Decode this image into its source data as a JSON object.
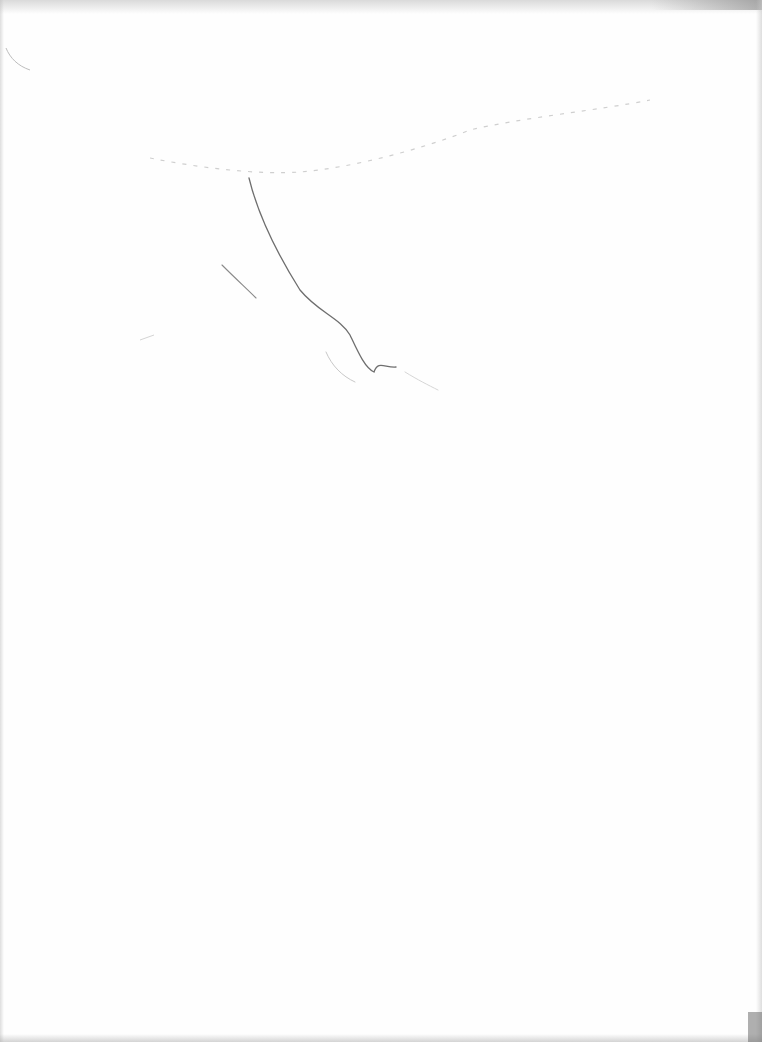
{
  "document": {
    "type": "scanned blank page",
    "text_content": "",
    "colors": {
      "paper": "#fefefe",
      "pencil_dark": "#6e6e6e",
      "pencil_light": "#c8c8c8",
      "scan_edge": "#9a9a9a"
    },
    "marks": [
      {
        "name": "main-curved-stroke",
        "description": "long pencil curve descending from upper center"
      },
      {
        "name": "short-diagonal-stroke",
        "description": "short diagonal pencil stroke to the left"
      },
      {
        "name": "faint-arc-stroke",
        "description": "faint arc near the bottom of the main curve"
      },
      {
        "name": "dotted-top-arc",
        "description": "faint dotted arc across upper part of page"
      }
    ]
  }
}
